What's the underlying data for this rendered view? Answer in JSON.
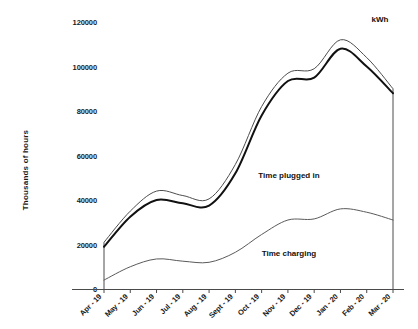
{
  "chart_data": {
    "type": "area",
    "title": "",
    "unit_label": "kWh",
    "ylabel": "Thousands of hours",
    "xlabel": "",
    "ylim": [
      0,
      120000
    ],
    "yticks": [
      0,
      20000,
      40000,
      60000,
      80000,
      100000,
      120000
    ],
    "ytick_labels": [
      "0",
      "20000",
      "40000",
      "60000",
      "80000",
      "100000",
      "120000"
    ],
    "grid": false,
    "legend_position": "inline-annotation",
    "categories": [
      "Apr - 19",
      "May - 19",
      "Jun - 19",
      "Jul - 19",
      "Aug - 19",
      "Sept - 19",
      "Oct - 19",
      "Nov - 19",
      "Dec - 19",
      "Jan - 20",
      "Feb - 20",
      "Mar - 20"
    ],
    "series": [
      {
        "name": "Time plugged in",
        "style": "thin-upper",
        "values": [
          21000,
          35000,
          44000,
          42000,
          40500,
          56000,
          82000,
          97000,
          99000,
          112000,
          104000,
          90000
        ]
      },
      {
        "name": "Time plugged in",
        "style": "thick-lower",
        "values": [
          19000,
          32500,
          40000,
          38500,
          37500,
          52000,
          78000,
          93500,
          95000,
          108000,
          100000,
          88000
        ]
      },
      {
        "name": "Time charging",
        "style": "thin-low",
        "values": [
          4000,
          10000,
          13500,
          12500,
          12000,
          16500,
          24500,
          31000,
          31500,
          36000,
          34500,
          31000
        ]
      }
    ],
    "annotations": [
      {
        "text": "Time plugged in",
        "x_frac": 0.64,
        "y_value": 50000
      },
      {
        "text": "Time charging",
        "x_frac": 0.64,
        "y_value": 15000
      },
      {
        "text": "kWh",
        "x_frac": 0.955,
        "y_value": 120000
      }
    ]
  }
}
